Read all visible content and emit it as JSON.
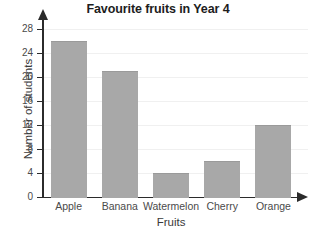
{
  "chart_data": {
    "type": "bar",
    "title": "Favourite fruits in Year 4",
    "xlabel": "Fruits",
    "ylabel": "Number of students",
    "categories": [
      "Apple",
      "Banana",
      "Watermelon",
      "Cherry",
      "Orange"
    ],
    "values": [
      26,
      21,
      4,
      6,
      12
    ],
    "ylim": [
      0,
      28
    ],
    "yticks": [
      0,
      4,
      8,
      12,
      16,
      20,
      24,
      28
    ],
    "ytick_labels": [
      "0",
      "4",
      "8",
      "12",
      "16",
      "20",
      "24",
      "28"
    ],
    "grid": true,
    "legend": null,
    "bar_color": "#a8a8a8",
    "axis_color": "#2b2b2b",
    "gridline_color": "#f0f0f0",
    "background_color": "#ffffff"
  }
}
